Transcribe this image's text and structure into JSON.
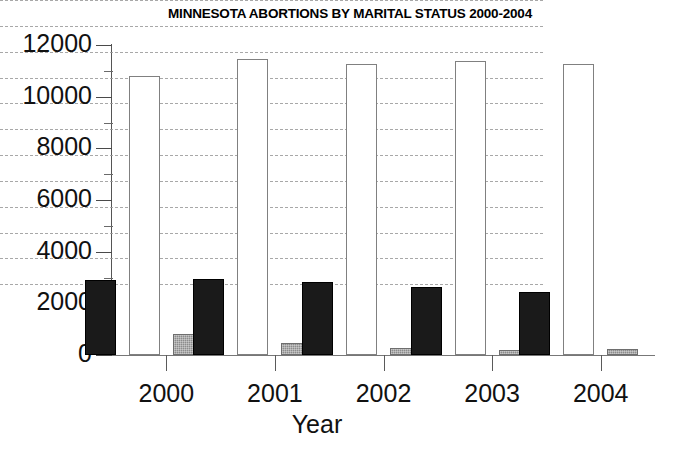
{
  "chart_data": {
    "type": "bar",
    "title": "MINNESOTA ABORTIONS BY MARITAL STATUS 2000-2004",
    "xlabel": "Year",
    "ylabel": "",
    "categories": [
      "2000",
      "2001",
      "2002",
      "2003",
      "2004"
    ],
    "ylim": [
      0,
      12000
    ],
    "ytick_labels": [
      "12000",
      "10000",
      "8000",
      "6000",
      "4000",
      "2000",
      "0"
    ],
    "ytick_values": [
      12000,
      10000,
      8000,
      6000,
      4000,
      2000,
      0
    ],
    "ytick_minor_values": [
      11000,
      9000,
      7000,
      5000,
      3000,
      1000
    ],
    "grid": true,
    "grid_style": "dashed-horizontal",
    "legend": "none",
    "series": [
      {
        "name": "Married",
        "style": "black-filled",
        "color": "#1a1a1a",
        "values": [
          2915,
          2950,
          2820,
          2650,
          2450
        ]
      },
      {
        "name": "Unmarried",
        "style": "white-outlined",
        "color": "#ffffff",
        "values": [
          10800,
          11460,
          11250,
          11400,
          11250
        ]
      },
      {
        "name": "Unknown",
        "style": "gray-hatched",
        "color": "#8c8c8c",
        "values": [
          810,
          470,
          260,
          180,
          240
        ]
      }
    ]
  }
}
